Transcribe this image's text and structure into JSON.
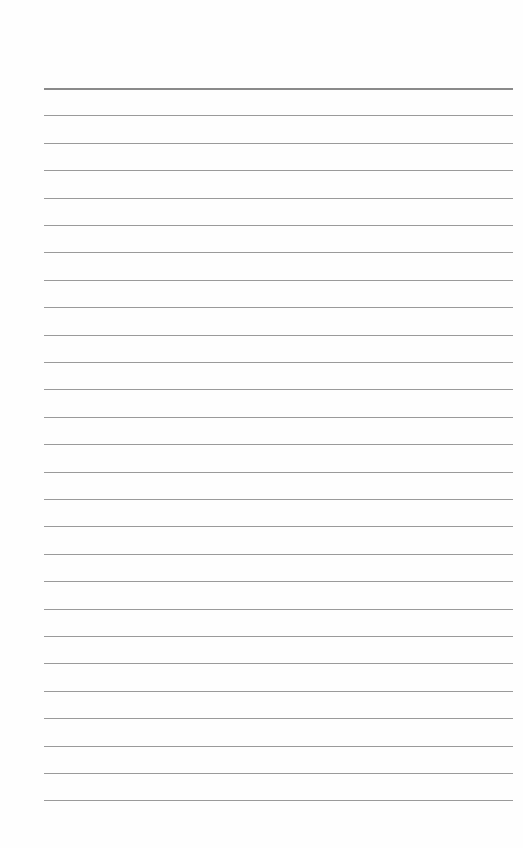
{
  "page": {
    "type": "lined-paper",
    "background_color": "#fefefe",
    "line_color": "#9a9a9a",
    "header_line_color": "#8a8a8a",
    "line_count": 27,
    "first_line_y": 88,
    "line_spacing": 27.4,
    "line_left": 44,
    "line_right": 513
  }
}
